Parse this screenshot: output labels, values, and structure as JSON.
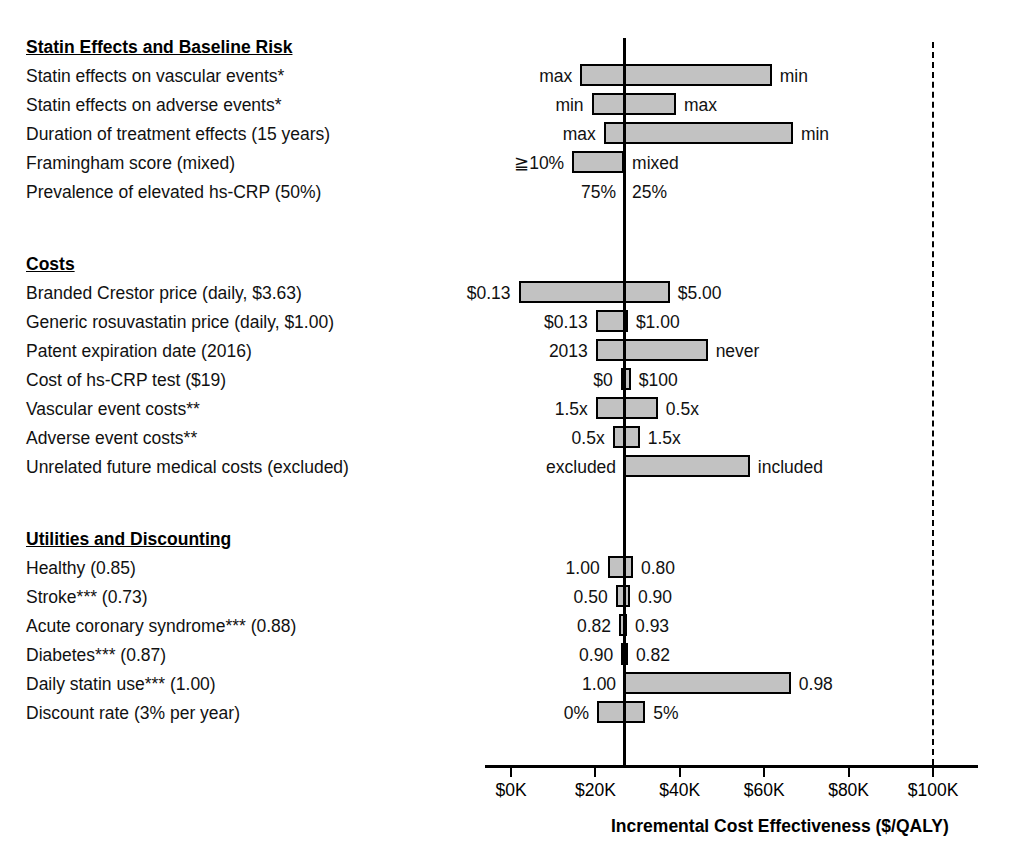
{
  "chart_data": {
    "type": "bar",
    "chart_style": "tornado",
    "title": "",
    "xlabel": "Incremental Cost Effectiveness ($/QALY)",
    "ylabel": "",
    "xlim": [
      -6000,
      110000
    ],
    "xticks": [
      0,
      20000,
      40000,
      60000,
      80000,
      100000
    ],
    "xticklabels": [
      "$0K",
      "$20K",
      "$40K",
      "$60K",
      "$80K",
      "$100K"
    ],
    "grid": false,
    "legend": null,
    "baseline_value": 26800,
    "reference_line_value": 100000,
    "reference_line_style": "dashed",
    "units": "$/QALY",
    "sections": [
      {
        "header": "Statin Effects and Baseline Risk",
        "rows": [
          {
            "label": "Statin effects on vascular events*",
            "low": 16400,
            "high": 61800,
            "low_label": "max",
            "high_label": "min"
          },
          {
            "label": "Statin effects on adverse events*",
            "low": 19100,
            "high": 39100,
            "low_label": "min",
            "high_label": "max"
          },
          {
            "label": "Duration of treatment effects (15 years)",
            "low": 22000,
            "high": 66800,
            "low_label": "max",
            "high_label": "min"
          },
          {
            "label": "Framingham score (mixed)",
            "low": 14500,
            "high": 26800,
            "low_label": "≧10%",
            "high_label": "mixed"
          },
          {
            "label": "Prevalence of elevated hs-CRP (50%)",
            "low": 26800,
            "high": 26800,
            "low_label": "75%",
            "high_label": "25%"
          }
        ]
      },
      {
        "header": "Costs",
        "rows": [
          {
            "label": "Branded Crestor price (daily, $3.63)",
            "low": 1800,
            "high": 37600,
            "low_label": "$0.13",
            "high_label": "$5.00"
          },
          {
            "label": "Generic rosuvastatin price (daily, $1.00)",
            "low": 20100,
            "high": 27700,
            "low_label": "$0.13",
            "high_label": "$1.00"
          },
          {
            "label": "Patent expiration date (2016)",
            "low": 20100,
            "high": 46600,
            "low_label": "2013",
            "high_label": "never"
          },
          {
            "label": "Cost of hs-CRP test ($19)",
            "low": 26000,
            "high": 28400,
            "low_label": "$0",
            "high_label": "$100"
          },
          {
            "label": "Vascular event costs**",
            "low": 20100,
            "high": 34800,
            "low_label": "1.5x",
            "high_label": "0.5x"
          },
          {
            "label": "Adverse event costs**",
            "low": 24100,
            "high": 30500,
            "low_label": "0.5x",
            "high_label": "1.5x"
          },
          {
            "label": "Unrelated future medical costs (excluded)",
            "low": 26800,
            "high": 56600,
            "low_label": "excluded",
            "high_label": "included"
          }
        ]
      },
      {
        "header": "Utilities and Discounting",
        "rows": [
          {
            "label": "Healthy (0.85)",
            "low": 22900,
            "high": 28900,
            "low_label": "1.00",
            "high_label": "0.80"
          },
          {
            "label": "Stroke*** (0.73)",
            "low": 24800,
            "high": 28200,
            "low_label": "0.50",
            "high_label": "0.90"
          },
          {
            "label": "Acute coronary syndrome*** (0.88)",
            "low": 25600,
            "high": 27500,
            "low_label": "0.82",
            "high_label": "0.93"
          },
          {
            "label": "Diabetes*** (0.87)",
            "low": 26100,
            "high": 27700,
            "low_label": "0.90",
            "high_label": "0.82"
          },
          {
            "label": "Daily statin use*** (1.00)",
            "low": 26800,
            "high": 66300,
            "low_label": "1.00",
            "high_label": "0.98"
          },
          {
            "label": "Discount rate (3% per year)",
            "low": 20400,
            "high": 31800,
            "low_label": "0%",
            "high_label": "5%"
          }
        ]
      }
    ]
  }
}
